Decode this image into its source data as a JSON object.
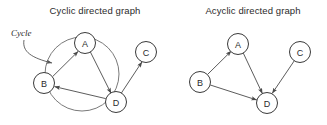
{
  "figure": {
    "width": 327,
    "height": 125,
    "background": "#ffffff",
    "stroke_color": "#4a4a4a",
    "text_color": "#2b2b2b"
  },
  "panels": [
    {
      "id": "cyclic",
      "title": "Cyclic directed graph",
      "title_x": 95,
      "title_y": 14,
      "nodes": [
        {
          "id": "A",
          "label": "A",
          "cx": 85,
          "cy": 43,
          "r": 10.5
        },
        {
          "id": "B",
          "label": "B",
          "cx": 44,
          "cy": 83,
          "r": 10.5
        },
        {
          "id": "C",
          "label": "C",
          "cx": 146,
          "cy": 52,
          "r": 10.5
        },
        {
          "id": "D",
          "label": "D",
          "cx": 116,
          "cy": 102,
          "r": 10.5
        }
      ],
      "edges": [
        {
          "from": "B",
          "to": "A",
          "type": "straight",
          "arrow": true
        },
        {
          "from": "A",
          "to": "D",
          "type": "straight",
          "arrow": true
        },
        {
          "from": "D",
          "to": "B",
          "type": "straight",
          "arrow": true
        },
        {
          "from": "D",
          "to": "C",
          "type": "straight",
          "arrow": true
        }
      ],
      "cycle_ring": {
        "cx": 82,
        "cy": 74,
        "r": 37
      },
      "annotation": {
        "label": "Cycle",
        "label_x": 11,
        "label_y": 36,
        "arrow_path": "M 24 40 C 22 52, 32 58, 52 63"
      }
    },
    {
      "id": "acyclic",
      "title": "Acyclic directed graph",
      "title_x": 253,
      "title_y": 14,
      "nodes": [
        {
          "id": "A",
          "label": "A",
          "cx": 238,
          "cy": 44,
          "r": 10.5
        },
        {
          "id": "B",
          "label": "B",
          "cx": 200,
          "cy": 82,
          "r": 10.5
        },
        {
          "id": "C",
          "label": "C",
          "cx": 300,
          "cy": 52,
          "r": 10.5
        },
        {
          "id": "D",
          "label": "D",
          "cx": 267,
          "cy": 103,
          "r": 10.5
        }
      ],
      "edges": [
        {
          "from": "B",
          "to": "A",
          "type": "straight",
          "arrow": true
        },
        {
          "from": "A",
          "to": "D",
          "type": "straight",
          "arrow": true
        },
        {
          "from": "B",
          "to": "D",
          "type": "straight",
          "arrow": true
        },
        {
          "from": "C",
          "to": "D",
          "type": "straight",
          "arrow": true
        }
      ],
      "cycle_ring": null,
      "annotation": null
    }
  ]
}
